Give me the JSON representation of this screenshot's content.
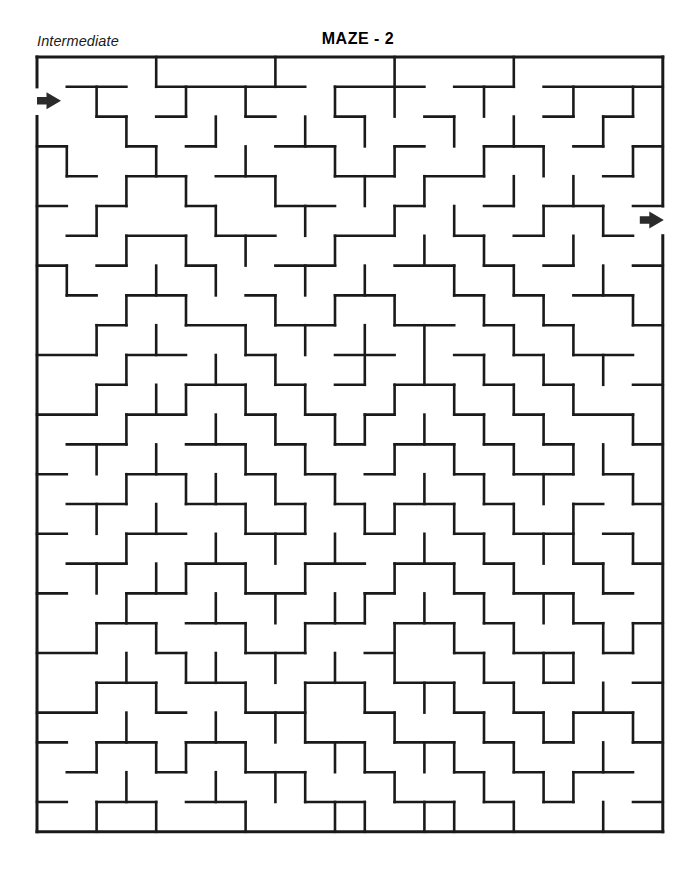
{
  "header": {
    "title": "MAZE - 2",
    "difficulty": "Intermediate"
  },
  "maze": {
    "cols": 21,
    "rows": 26,
    "cell": 29.8,
    "origin_x": 37,
    "origin_y": 57,
    "wall_color": "#1a1a1a",
    "background_color": "#ffffff",
    "wall_thickness": 2.6,
    "border_thickness": 3.0,
    "entrance": {
      "side": "left",
      "row": 1,
      "label": "entrance-arrow"
    },
    "exit": {
      "side": "right",
      "row": 5,
      "label": "exit-arrow"
    },
    "arrow_color": "#2b2b2b",
    "h_walls": [
      "111111111111111111111",
      "011011111011101101111",
      "001010010010010001010",
      "100101001100100110101",
      "010110110011011000010",
      "101001001100100101101",
      "010110110011001010010",
      "101001001100110101001",
      "010110010011001010110",
      "001001101100110101001",
      "110110010011001010110",
      "001001101010110101001",
      "110110010101001010110",
      "011001101010110101001",
      "100110010101001011010",
      "011001101010110100101",
      "100110011001001011010",
      "011001100110110100101",
      "100110011001001011010",
      "001101100110110100101",
      "110010011001001011010",
      "001101100110110101001",
      "110010011001001010110",
      "101101100110110101001",
      "010010011001001010110",
      "101101100110110101001",
      "111111111111111111111"
    ],
    "v_walls": [
      "1000100010001000100001",
      "1010010100101001001011",
      "1001001001010010100101",
      "1100100100101001010011",
      "1001010010010100101001",
      "1010001001001010010101",
      "1001010100100101001001",
      "1100101001010010100101",
      "1001010010101001010011",
      "1010100101010100101001",
      "1001001010010101010101",
      "1010110101001010101001",
      "1001001010110101010011",
      "1010100101001010101101",
      "1001011010100101010011",
      "1010100101011010101001",
      "1001001010100101011011",
      "1010110101001010100101",
      "1001001010110101011001",
      "1010100101001010100111",
      "1001011010101001011001",
      "1010100101010110100101",
      "1001001011001001011011",
      "1010110100110110100101",
      "1001001011001001011001",
      "1010100100110110100101"
    ]
  }
}
